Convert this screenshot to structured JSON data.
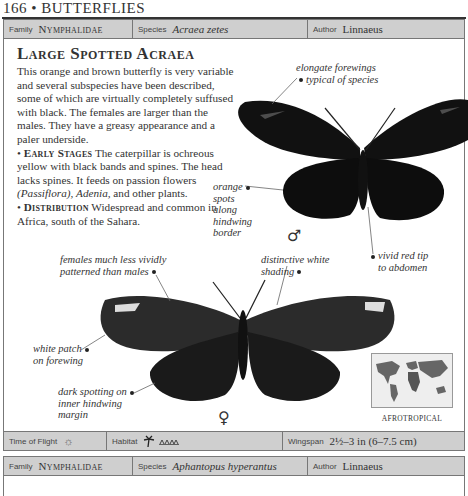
{
  "page_header": {
    "number": "166",
    "bullet": "•",
    "section": "BUTTERFLIES"
  },
  "entry1": {
    "family_label": "Family",
    "family": "Nymphalidae",
    "species_label": "Species",
    "species": "Acraea zetes",
    "author_label": "Author",
    "author": "Linnaeus",
    "title": "Large Spotted Acraea",
    "description": "This orange and brown butterfly is very variable and several subspecies have been described, some of which are virtually completely suffused with black. The females are larger than the males. They have a greasy appearance and a paler underside.",
    "early_stages_heading": "Early Stages",
    "early_stages_text": "The caterpillar is ochreous yellow with black bands and spines. The head lacks spines. It feeds on passion flowers",
    "early_stages_genus1": "(Passiflora),",
    "early_stages_genus2": "Adenia,",
    "early_stages_end": "and other plants.",
    "distribution_heading": "Distribution",
    "distribution_text": "Widespread and common in Africa, south of the Sahara.",
    "callouts": {
      "forewings": [
        "elongate forewings",
        "typical of species"
      ],
      "orange_spots": [
        "orange",
        "spots",
        "along",
        "hindwing",
        "border"
      ],
      "red_tip": [
        "vivid red tip",
        "to abdomen"
      ],
      "females": [
        "females much less vividly",
        "patterned than males"
      ],
      "white_shading": [
        "distinctive white",
        "shading"
      ],
      "white_patch": [
        "white patch",
        "on forewing"
      ],
      "dark_spotting": [
        "dark spotting on",
        "inner hindwing",
        "margin"
      ]
    },
    "male_symbol": "♂",
    "female_symbol": "♀",
    "region": "AFROTROPICAL",
    "time_of_flight_label": "Time of Flight",
    "time_of_flight_icon": "sun-icon",
    "habitat_label": "Habitat",
    "habitat_icons": [
      "palm-tree-icon",
      "grassland-icon"
    ],
    "wingspan_label": "Wingspan",
    "wingspan": "2½–3 in (6–7.5 cm)"
  },
  "entry2": {
    "family_label": "Family",
    "family": "Nymphalidae",
    "species_label": "Species",
    "species": "Aphantopus hyperantus",
    "author_label": "Author",
    "author": "Linnaeus"
  },
  "colors": {
    "bar_bg": "#cfcfcf",
    "border": "#777777",
    "wing": "#111111"
  }
}
